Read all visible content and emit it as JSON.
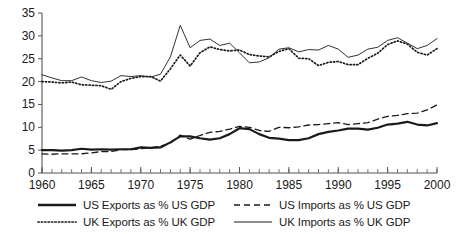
{
  "chart_data": {
    "type": "line",
    "title": "",
    "subtitle": "",
    "xlabel": "",
    "ylabel": "",
    "xlim": [
      1960,
      2000
    ],
    "ylim": [
      0,
      35
    ],
    "yticks": [
      0,
      5,
      10,
      15,
      20,
      25,
      30,
      35
    ],
    "ytick_labels": [
      "0",
      "5",
      "10",
      "15",
      "20",
      "25",
      "30",
      "35"
    ],
    "xticks": [
      1960,
      1965,
      1970,
      1975,
      1980,
      1985,
      1990,
      1995,
      2000
    ],
    "xtick_labels": [
      "1960",
      "1965",
      "1970",
      "1975",
      "1980",
      "1985",
      "1990",
      "1995",
      "2000"
    ],
    "minor_xticks_every": 1,
    "grid": false,
    "legend_position": "below",
    "x": [
      1960,
      1961,
      1962,
      1963,
      1964,
      1965,
      1966,
      1967,
      1968,
      1969,
      1970,
      1971,
      1972,
      1973,
      1974,
      1975,
      1976,
      1977,
      1978,
      1979,
      1980,
      1981,
      1982,
      1983,
      1984,
      1985,
      1986,
      1987,
      1988,
      1989,
      1990,
      1991,
      1992,
      1993,
      1994,
      1995,
      1996,
      1997,
      1998,
      1999,
      2000
    ],
    "series": [
      {
        "name": "US Exports as % US GDP",
        "style": "solid-thick",
        "values": [
          5.0,
          5.0,
          4.9,
          5.0,
          5.3,
          5.1,
          5.2,
          5.1,
          5.2,
          5.2,
          5.6,
          5.5,
          5.6,
          6.7,
          8.0,
          8.0,
          7.6,
          7.3,
          7.6,
          8.5,
          9.8,
          9.6,
          8.5,
          7.7,
          7.5,
          7.2,
          7.2,
          7.6,
          8.5,
          9.0,
          9.3,
          9.7,
          9.7,
          9.5,
          9.9,
          10.6,
          10.8,
          11.2,
          10.6,
          10.4,
          10.9
        ]
      },
      {
        "name": "US Imports as % US GDP",
        "style": "dashed",
        "values": [
          4.2,
          4.1,
          4.2,
          4.2,
          4.2,
          4.4,
          4.7,
          4.7,
          5.1,
          5.1,
          5.3,
          5.5,
          5.9,
          6.5,
          8.3,
          7.4,
          8.2,
          8.9,
          9.1,
          9.6,
          10.2,
          10.0,
          9.3,
          9.1,
          10.0,
          9.9,
          10.1,
          10.5,
          10.6,
          10.8,
          11.0,
          10.6,
          10.8,
          11.0,
          11.8,
          12.4,
          12.6,
          13.0,
          13.1,
          13.8,
          14.9
        ]
      },
      {
        "name": "UK Exports as % UK GDP",
        "style": "dotted",
        "values": [
          20.0,
          19.9,
          19.7,
          19.9,
          19.3,
          19.2,
          19.1,
          18.3,
          20.0,
          20.7,
          21.1,
          21.1,
          20.1,
          22.8,
          25.8,
          23.4,
          26.3,
          27.6,
          27.0,
          26.7,
          26.9,
          25.9,
          25.6,
          25.4,
          26.6,
          27.2,
          25.1,
          25.0,
          23.5,
          24.2,
          24.4,
          23.7,
          23.7,
          25.1,
          26.2,
          28.1,
          28.9,
          28.2,
          26.4,
          25.8,
          27.2
        ]
      },
      {
        "name": "UK Imports as % UK GDP",
        "style": "solid-thin",
        "values": [
          21.5,
          20.8,
          20.2,
          20.2,
          21.0,
          20.2,
          19.8,
          20.1,
          21.3,
          21.1,
          21.3,
          21.0,
          21.6,
          25.4,
          32.3,
          27.4,
          29.0,
          29.3,
          27.9,
          28.4,
          26.3,
          24.1,
          24.3,
          25.2,
          27.1,
          27.4,
          26.5,
          27.0,
          26.9,
          27.9,
          27.1,
          25.3,
          25.8,
          27.1,
          27.5,
          29.0,
          29.6,
          28.4,
          27.2,
          27.9,
          29.4
        ]
      }
    ]
  },
  "legend": {
    "entries": [
      {
        "label": "US Exports as % US GDP",
        "style": "solid-thick"
      },
      {
        "label": "US Imports as % US GDP",
        "style": "dashed"
      },
      {
        "label": "UK Exports as % UK GDP",
        "style": "dotted"
      },
      {
        "label": "UK Imports as % UK GDP",
        "style": "solid-thin"
      }
    ]
  }
}
